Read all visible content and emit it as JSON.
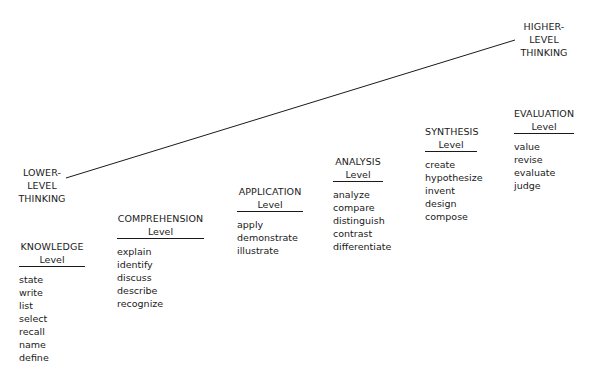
{
  "diagram": {
    "lower_label": [
      "LOWER-",
      "LEVEL",
      "THINKING"
    ],
    "higher_label": [
      "HIGHER-",
      "LEVEL",
      "THINKING"
    ],
    "trend_line": {
      "x1": 66,
      "y1": 178,
      "x2": 515,
      "y2": 40,
      "color": "#1a1a1a"
    },
    "levels": [
      {
        "name": "KNOWLEDGE",
        "sub": "Level",
        "verbs": [
          "state",
          "write",
          "list",
          "select",
          "recall",
          "name",
          "define"
        ]
      },
      {
        "name": "COMPREHENSION",
        "sub": "Level",
        "verbs": [
          "explain",
          "identify",
          "discuss",
          "describe",
          "recognize"
        ]
      },
      {
        "name": "APPLICATION",
        "sub": "Level",
        "verbs": [
          "apply",
          "demonstrate",
          "illustrate"
        ]
      },
      {
        "name": "ANALYSIS",
        "sub": "Level",
        "verbs": [
          "analyze",
          "compare",
          "distinguish",
          "contrast",
          "differentiate"
        ]
      },
      {
        "name": "SYNTHESIS",
        "sub": "Level",
        "verbs": [
          "create",
          "hypothesize",
          "invent",
          "design",
          "compose"
        ]
      },
      {
        "name": "EVALUATION",
        "sub": "Level",
        "verbs": [
          "value",
          "revise",
          "evaluate",
          "judge"
        ]
      }
    ]
  }
}
